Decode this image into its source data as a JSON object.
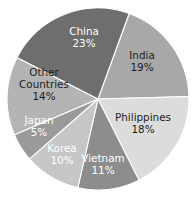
{
  "chart_data": {
    "type": "pie",
    "title": "",
    "subtitle": "",
    "xlabel": "",
    "ylabel": "",
    "legend_position": "none",
    "grid": false,
    "labels_inside_slices": true,
    "start_angle_deg": 20,
    "direction": "clockwise",
    "center": {
      "x": 98,
      "y": 99
    },
    "radius": 91,
    "categories": [
      "India",
      "Philippines",
      "Vietnam",
      "Korea",
      "Japan",
      "Other Countries",
      "China"
    ],
    "values": [
      19,
      18,
      11,
      10,
      5,
      14,
      23
    ],
    "value_suffix": "%",
    "slices": [
      {
        "name": "India",
        "label": "India",
        "value": 19,
        "value_text": "19%",
        "color": "#a8a8a8",
        "text_color": "#1c1c1c",
        "text_tone": "dark",
        "label_x": 142,
        "label_y": 62,
        "label_lines": [
          "India"
        ]
      },
      {
        "name": "Philippines",
        "label": "Philippines",
        "value": 18,
        "value_text": "18%",
        "color": "#dcdcdc",
        "text_color": "#1c1c1c",
        "text_tone": "dark",
        "label_x": 143,
        "label_y": 124,
        "label_lines": [
          "Philippines"
        ]
      },
      {
        "name": "Vietnam",
        "label": "Vietnam",
        "value": 11,
        "value_text": "11%",
        "color": "#8d8d8d",
        "text_color": "#ffffff",
        "text_tone": "light",
        "label_x": 103,
        "label_y": 165,
        "label_lines": [
          "Vietnam"
        ]
      },
      {
        "name": "Korea",
        "label": "Korea",
        "value": 10,
        "value_text": "10%",
        "color": "#c6c6c6",
        "text_color": "#ffffff",
        "text_tone": "light",
        "label_x": 62,
        "label_y": 155,
        "label_lines": [
          "Korea"
        ]
      },
      {
        "name": "Japan",
        "label": "Japan",
        "value": 5,
        "value_text": "5%",
        "color": "#9a9a9a",
        "text_color": "#ffffff",
        "text_tone": "light",
        "label_x": 39,
        "label_y": 127,
        "label_lines": [
          "Japan"
        ]
      },
      {
        "name": "Other Countries",
        "label": "Other Countries",
        "value": 14,
        "value_text": "14%",
        "color": "#b4b4b4",
        "text_color": "#1c1c1c",
        "text_tone": "dark",
        "label_x": 44,
        "label_y": 85,
        "label_lines": [
          "Other",
          "Countries"
        ]
      },
      {
        "name": "China",
        "label": "China",
        "value": 23,
        "value_text": "23%",
        "color": "#6e6e6e",
        "text_color": "#ffffff",
        "text_tone": "light",
        "label_x": 84,
        "label_y": 38,
        "label_lines": [
          "China"
        ]
      }
    ],
    "background_color": "#ffffff",
    "slice_border_color": "#ffffff"
  }
}
